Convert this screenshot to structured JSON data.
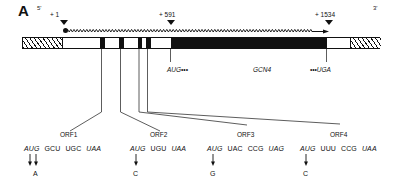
{
  "figure": {
    "panel_letter": "A",
    "five_prime": "5'",
    "three_prime": "3'",
    "positions": [
      {
        "label": "+ 1",
        "x": 60
      },
      {
        "label": "+ 591",
        "x": 163
      },
      {
        "label": "+ 1534",
        "x": 322
      }
    ],
    "gene_features": {
      "gcn4_label": "GCN4",
      "start_codon_label": "AUG•••",
      "stop_codon_label": "•••UGA"
    },
    "uorfs": [
      {
        "name": "ORF1",
        "codons": [
          {
            "text": "AUG",
            "italic": true
          },
          {
            "text": "GCU",
            "italic": false
          },
          {
            "text": "UGC",
            "italic": false
          },
          {
            "text": "UAA",
            "italic": true
          }
        ],
        "mutation_base": "A",
        "arrows": 2
      },
      {
        "name": "ORF2",
        "codons": [
          {
            "text": "AUG",
            "italic": true
          },
          {
            "text": "UGU",
            "italic": false
          },
          {
            "text": "UAA",
            "italic": true
          }
        ],
        "mutation_base": "C",
        "arrows": 1
      },
      {
        "name": "ORF3",
        "codons": [
          {
            "text": "AUG",
            "italic": true
          },
          {
            "text": "UAC",
            "italic": false
          },
          {
            "text": "CCG",
            "italic": false
          },
          {
            "text": "UAG",
            "italic": true
          }
        ],
        "mutation_base": "G",
        "arrows": 1
      },
      {
        "name": "ORF4",
        "codons": [
          {
            "text": "AUG",
            "italic": true
          },
          {
            "text": "UUU",
            "italic": false
          },
          {
            "text": "CCG",
            "italic": false
          },
          {
            "text": "UAA",
            "italic": true
          }
        ],
        "mutation_base": "C",
        "arrows": 1
      }
    ],
    "colors": {
      "ink": "#111111",
      "background": "#ffffff"
    }
  }
}
